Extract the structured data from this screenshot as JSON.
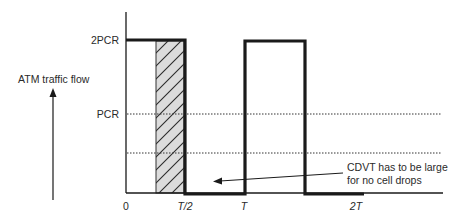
{
  "diagram": {
    "title_label": "ATM traffic flow",
    "y_axis": {
      "ticks": [
        {
          "label": "2PCR",
          "y": 40
        },
        {
          "label": "PCR",
          "y": 114
        }
      ],
      "extra_dotted_level_y": 153
    },
    "x_axis": {
      "ticks": [
        {
          "label": "0",
          "x": 126
        },
        {
          "label": "T/2",
          "x": 185
        },
        {
          "label": "T",
          "x": 244
        },
        {
          "label": "2T",
          "x": 356
        }
      ]
    },
    "annotation": {
      "line1": "CDVT has to be large",
      "line2": "for no cell drops"
    },
    "colors": {
      "stroke": "#1a1a1a",
      "hatch_fill": "#dcdcdc",
      "text": "#2a2a2a"
    }
  }
}
